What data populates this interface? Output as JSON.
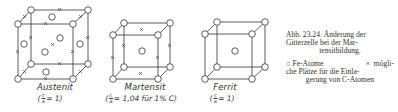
{
  "figure": {
    "cells": [
      {
        "name": "Austenit",
        "ratio_prefix": "(",
        "ratio_num": "c",
        "ratio_den": "a",
        "ratio_suffix": " = 1)"
      },
      {
        "name": "Martensit",
        "ratio_prefix": "(",
        "ratio_num": "c",
        "ratio_den": "a",
        "ratio_suffix": " = 1,04 für 1% C)"
      },
      {
        "name": "Ferrit",
        "ratio_prefix": "(",
        "ratio_num": "c",
        "ratio_den": "a",
        "ratio_suffix": " = 1)"
      }
    ]
  },
  "caption": {
    "line1": "Abb. 23.24. Änderung der",
    "line2": "Gitterzelle bei der Mar-",
    "line3": "tensitbildung."
  },
  "legend": {
    "fe_symbol": "○",
    "fe_label": "Fe-Atome",
    "c_symbol": "×",
    "c_label_1": "mögli-",
    "line2": "che Plätze für die Einla-",
    "line3": "gerung von C-Atomen"
  },
  "colors": {
    "line": "#333333",
    "background": "#ffffff"
  }
}
